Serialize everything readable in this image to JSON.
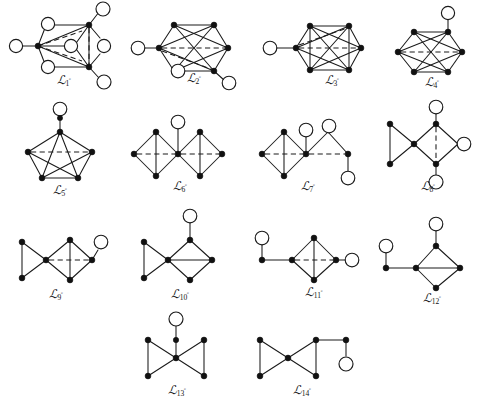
{
  "figure": {
    "caption": "",
    "background_color": "#ffffff",
    "ink_color": "#111111",
    "vertex_styles": {
      "filled": "solid black disk",
      "open": "white circle with black outline"
    },
    "edge_styles": {
      "solid": "solid line",
      "dashed": "dashed line"
    },
    "rows": [
      {
        "graphs": [
          1,
          2,
          3,
          4
        ]
      },
      {
        "graphs": [
          5,
          6,
          7,
          8
        ]
      },
      {
        "graphs": [
          9,
          10,
          11,
          12
        ]
      },
      {
        "graphs": [
          13,
          14
        ]
      }
    ]
  },
  "graphs": [
    {
      "id": "L1",
      "label_base": "ℒ",
      "label_sub": "1",
      "label_sup": "◦",
      "label_text": "ℒ1°",
      "filled_count": 3,
      "open_count": 6,
      "dashed_edges": 3,
      "description": "hexagonal core with one left apex filled, two right vertices filled, six open circles attached"
    },
    {
      "id": "L2",
      "label_base": "ℒ",
      "label_sub": "2",
      "label_sup": "◦",
      "label_text": "ℒ2°",
      "filled_count": 4,
      "open_count": 3,
      "dashed_edges": 2,
      "description": "hexagonal core, four filled vertices with crossing chords, two pendant open circles"
    },
    {
      "id": "L3",
      "label_base": "ℒ",
      "label_sub": "3",
      "label_sup": "◦",
      "label_text": "ℒ3°",
      "filled_count": 6,
      "open_count": 1,
      "dashed_edges": 2,
      "description": "near-complete hexagon of six filled vertices with one pendant open circle on the left"
    },
    {
      "id": "L4",
      "label_base": "ℒ",
      "label_sub": "4",
      "label_sup": "◦",
      "label_text": "ℒ4°",
      "filled_count": 6,
      "open_count": 1,
      "dashed_edges": 1,
      "description": "hexagon of six filled vertices with crossing chords and one pendant open circle on top"
    },
    {
      "id": "L5",
      "label_base": "ℒ",
      "label_sub": "5",
      "label_sup": "◦",
      "label_text": "ℒ5°",
      "filled_count": 5,
      "open_count": 1,
      "dashed_edges": 1,
      "description": "complete pentagon K5 of filled vertices with a pendant open circle above the apex"
    },
    {
      "id": "L6",
      "label_base": "ℒ",
      "label_sub": "6",
      "label_sup": "◦",
      "label_text": "ℒ6°",
      "filled_count": 7,
      "open_count": 1,
      "dashed_edges": 2,
      "description": "two diamonds sharing a central filled vertex, pendant open circle above center"
    },
    {
      "id": "L7",
      "label_base": "ℒ",
      "label_sub": "7",
      "label_sup": "◦",
      "label_text": "ℒ7°",
      "filled_count": 5,
      "open_count": 3,
      "dashed_edges": 1,
      "description": "left diamond joined to a right path, three open circles"
    },
    {
      "id": "L8",
      "label_base": "ℒ",
      "label_sub": "8",
      "label_sup": "◦",
      "label_text": "ℒ8°",
      "filled_count": 5,
      "open_count": 3,
      "dashed_edges": 1,
      "description": "left triangle and right diamond sharing a vertex, three open circles"
    },
    {
      "id": "L9",
      "label_base": "ℒ",
      "label_sub": "9",
      "label_sup": "◦",
      "label_text": "ℒ9°",
      "filled_count": 6,
      "open_count": 1,
      "dashed_edges": 1,
      "description": "left triangle and right diamond sharing a vertex, one open circle upper right"
    },
    {
      "id": "L10",
      "label_base": "ℒ",
      "label_sub": "10",
      "label_sup": "◦",
      "label_text": "ℒ10°",
      "filled_count": 6,
      "open_count": 1,
      "dashed_edges": 0,
      "description": "left triangle and right diamond sharing a vertex, open circle pendant on top"
    },
    {
      "id": "L11",
      "label_base": "ℒ",
      "label_sub": "11",
      "label_sup": "◦",
      "label_text": "ℒ11°",
      "filled_count": 5,
      "open_count": 2,
      "dashed_edges": 1,
      "description": "central diamond with a left pendant path and right pendant open circle"
    },
    {
      "id": "L12",
      "label_base": "ℒ",
      "label_sub": "12",
      "label_sup": "◦",
      "label_text": "ℒ12°",
      "filled_count": 5,
      "open_count": 2,
      "dashed_edges": 0,
      "description": "diamond with a left pendant path and a top pendant open circle"
    },
    {
      "id": "L13",
      "label_base": "ℒ",
      "label_sub": "13",
      "label_sup": "◦",
      "label_text": "ℒ13°",
      "filled_count": 6,
      "open_count": 1,
      "dashed_edges": 0,
      "description": "bowtie of two triangles with a pendant vertex and open circle above the center"
    },
    {
      "id": "L14",
      "label_base": "ℒ",
      "label_sub": "14",
      "label_sup": "◦",
      "label_text": "ℒ14°",
      "filled_count": 7,
      "open_count": 1,
      "dashed_edges": 0,
      "description": "bowtie of two triangles with a path to the right ending in an open circle"
    }
  ]
}
